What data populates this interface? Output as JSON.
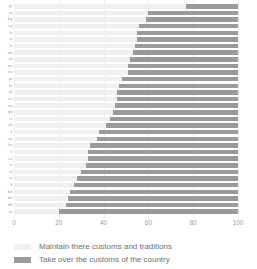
{
  "chart_data": {
    "type": "bar",
    "subtype": "stacked-horizontal-100",
    "title": "",
    "subtitle": "",
    "xlabel": "",
    "ylabel": "",
    "xlim": [
      0,
      100
    ],
    "xticks": [
      "0",
      "20",
      "40",
      "60",
      "80",
      "100"
    ],
    "xtick_values": [
      0,
      20,
      40,
      60,
      80,
      100
    ],
    "grid": true,
    "legend_position": "bottom-left",
    "orientation": "horizontal",
    "categories": [
      "gr",
      "ro",
      "bg",
      "cy",
      "lu",
      "ie",
      "lv",
      "mt",
      "sk",
      "ee",
      "es",
      "pt",
      "hr",
      "pl",
      "cv",
      "ua",
      "gb",
      "rs",
      "sk2",
      "lt",
      "se",
      "hu",
      "fi",
      "cz",
      "si",
      "nl",
      "is",
      "lt2",
      "be",
      "de",
      "dk",
      "at"
    ],
    "series": [
      {
        "name": "Maintain there customs and traditions",
        "color": "#f0f0f0",
        "values": [
          77,
          60,
          59,
          56,
          55,
          55,
          54,
          53,
          52,
          51,
          51,
          48,
          47,
          46,
          46,
          45,
          44,
          43,
          41,
          38,
          37,
          34,
          33,
          33,
          32,
          30,
          28,
          27,
          25,
          24,
          23,
          20
        ]
      },
      {
        "name": "Take over the customs of the country",
        "color": "#9a9a9a",
        "values": [
          23,
          40,
          41,
          44,
          45,
          45,
          46,
          47,
          48,
          49,
          49,
          52,
          53,
          54,
          54,
          55,
          56,
          57,
          59,
          62,
          63,
          66,
          67,
          67,
          68,
          70,
          72,
          73,
          75,
          76,
          77,
          80
        ]
      }
    ]
  },
  "legend": {
    "items": [
      {
        "label": "Maintain there customs and traditions",
        "swatch_class": "maintain"
      },
      {
        "label": "Take over the customs of the country",
        "swatch_class": "takeover"
      }
    ]
  }
}
